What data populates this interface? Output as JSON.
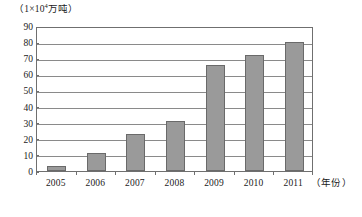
{
  "chart_data": {
    "type": "bar",
    "title": "",
    "subtitle": "",
    "unit_caption": {
      "prefix": "（1×10",
      "exponent": "4",
      "suffix": "万吨）"
    },
    "categories": [
      "2005",
      "2006",
      "2007",
      "2008",
      "2009",
      "2010",
      "2011"
    ],
    "values": [
      3,
      11,
      23,
      31,
      66,
      72,
      80
    ],
    "series": [
      {
        "name": "产量",
        "values": [
          3,
          11,
          23,
          31,
          66,
          72,
          80
        ]
      }
    ],
    "xlabel": "（年份）",
    "ylabel": "",
    "ylim": [
      0,
      90
    ],
    "ytick_labels": [
      "0",
      "10",
      "20",
      "30",
      "40",
      "50",
      "60",
      "70",
      "80",
      "90"
    ],
    "ytick_values": [
      0,
      10,
      20,
      30,
      40,
      50,
      60,
      70,
      80,
      90
    ],
    "ytick_step": 10,
    "grid": true,
    "grid_orientation": "horizontal",
    "legend": false,
    "legend_position": "none",
    "colors": {
      "bar_fill": "#9a9a9a",
      "bar_border": "#6a6a6a",
      "gridline": "#8a8a8a",
      "axis": "#6f6f6f",
      "text": "#1a1a1a",
      "background": "#ffffff"
    }
  }
}
